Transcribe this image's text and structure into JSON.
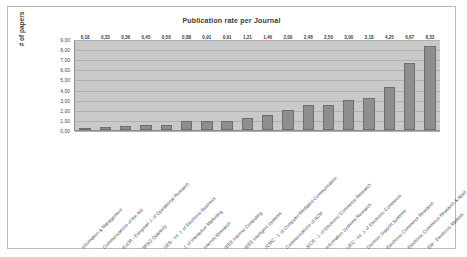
{
  "chart_data": {
    "type": "bar",
    "title": "Publication rate per Journal",
    "xlabel": "",
    "ylabel": "# of papers",
    "ylim": [
      0,
      9
    ],
    "ytick_step": 1,
    "ytick_labels": [
      "9,00",
      "8,00",
      "7,00",
      "6,00",
      "5,00",
      "4,00",
      "3,00",
      "2,00",
      "1,00",
      "0,00"
    ],
    "grid": true,
    "legend": "none",
    "bar_color": "#8e8e8e",
    "plot_background": "#c9c9c9",
    "categories": [
      "Information & Management",
      "Communications of the AIS",
      "EJOR - European J. of Operational Research",
      "MISQ Quarterly",
      "IJEB - Int. J. of Electronic Business",
      "J. of Interactive Marketing",
      "Internet Research",
      "IEEE Internet Computing",
      "IEEE Intelligent Systems",
      "JCMC - J. of Computer-Mediated Communication",
      "Communications of ACM",
      "JECR - J. of Electronic Commerce Research",
      "Information Systems Research",
      "IJEC - Int. J. of Electronic Commerce",
      "Decision Support Systems",
      "Electronic Commerce Research",
      "Electronic Commerce Research & Apps",
      "EM - Electronic Markets"
    ],
    "values": [
      0.18,
      0.33,
      0.36,
      0.45,
      0.5,
      0.88,
      0.91,
      0.91,
      1.21,
      1.46,
      2.0,
      2.48,
      2.5,
      3.0,
      3.18,
      4.25,
      6.67,
      8.33
    ],
    "value_labels": [
      "0,18",
      "0,33",
      "0,36",
      "0,45",
      "0,50",
      "0,88",
      "0,91",
      "0,91",
      "1,21",
      "1,46",
      "2,00",
      "2,48",
      "2,50",
      "3,00",
      "3,18",
      "4,25",
      "6,67",
      "8,33"
    ]
  }
}
